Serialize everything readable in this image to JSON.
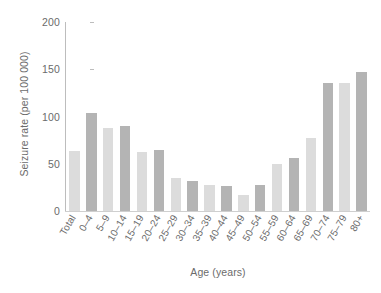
{
  "chart_data": {
    "type": "bar",
    "title": "",
    "xlabel": "Age (years)",
    "ylabel": "Seizure rate (per 100 000)",
    "categories": [
      "Total",
      "0–4",
      "5–9",
      "10–14",
      "15–19",
      "20–24",
      "25–29",
      "30–34",
      "35–39",
      "40–44",
      "45–49",
      "50–54",
      "55–59",
      "60–64",
      "65–69",
      "70–74",
      "75–79",
      "80+"
    ],
    "values": [
      64,
      104,
      88,
      90,
      62,
      65,
      35,
      32,
      28,
      27,
      17,
      28,
      50,
      56,
      77,
      135,
      135,
      147
    ],
    "bar_colors": [
      "#dcdcdc",
      "#b4b4b4",
      "#dcdcdc",
      "#b4b4b4",
      "#dcdcdc",
      "#b4b4b4",
      "#dcdcdc",
      "#b4b4b4",
      "#dcdcdc",
      "#b4b4b4",
      "#dcdcdc",
      "#b4b4b4",
      "#dcdcdc",
      "#b4b4b4",
      "#dcdcdc",
      "#b4b4b4",
      "#dcdcdc",
      "#b4b4b4"
    ],
    "ylim": [
      0,
      200
    ],
    "yticks": [
      0,
      50,
      100,
      150,
      200
    ],
    "ytick_labels": [
      "0",
      "50",
      "100",
      "150",
      "200"
    ],
    "grid": false,
    "legend": null,
    "axis_color": "#bdbdbd",
    "text_color": "#6b6b6b",
    "background": "#ffffff"
  }
}
